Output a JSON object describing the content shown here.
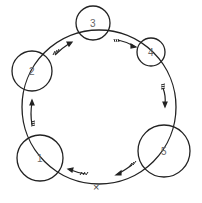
{
  "diagram": {
    "main_circle": {
      "cx": 99,
      "cy": 107,
      "r": 77
    },
    "start_mark": {
      "label": "×",
      "x": 98,
      "y": 187
    },
    "nodes": [
      {
        "label": "1",
        "cx": 40,
        "cy": 158,
        "r": 23
      },
      {
        "label": "2",
        "cx": 32,
        "cy": 71,
        "r": 20
      },
      {
        "label": "3",
        "cx": 93,
        "cy": 23,
        "r": 17
      },
      {
        "label": "4",
        "cx": 151,
        "cy": 52,
        "r": 14
      },
      {
        "label": "5",
        "cx": 164,
        "cy": 151,
        "r": 26
      }
    ],
    "direction": "clockwise"
  }
}
